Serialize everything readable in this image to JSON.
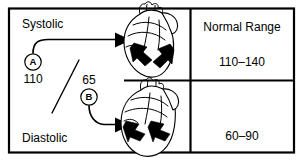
{
  "figure": {
    "line_color": "#000000",
    "background_color": "#ffffff"
  },
  "left_panel": {
    "systolic": {
      "label": "Systolic",
      "marker_letter": "A",
      "reading": "110",
      "heart_icon": "heart-contracted-icon"
    },
    "diastolic": {
      "label": "Diastolic",
      "marker_letter": "B",
      "reading": "65",
      "heart_icon": "heart-relaxed-icon"
    },
    "fraction_separator": "/"
  },
  "right_panel": {
    "header": "Normal Range",
    "systolic_range": "110–140",
    "diastolic_range": "60–90"
  }
}
